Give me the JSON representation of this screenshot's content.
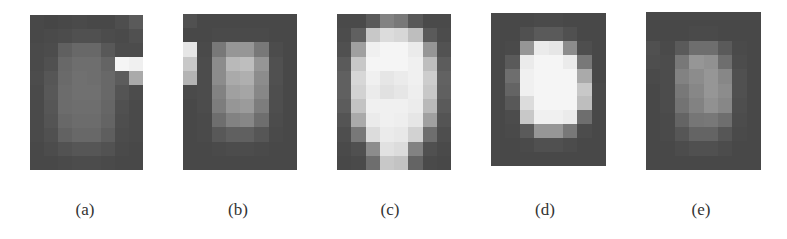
{
  "figure": {
    "panels": [
      {
        "id": "a",
        "label": "(a)",
        "x": 30,
        "y": 15,
        "w": 113,
        "h": 155,
        "label_x": 85,
        "cols": 8,
        "rows": 11,
        "grid": [
          [
            72,
            70,
            72,
            74,
            72,
            72,
            78,
            90
          ],
          [
            72,
            74,
            76,
            80,
            80,
            76,
            74,
            80
          ],
          [
            74,
            76,
            96,
            104,
            104,
            88,
            76,
            76
          ],
          [
            74,
            80,
            104,
            110,
            110,
            100,
            245,
            240
          ],
          [
            76,
            86,
            106,
            112,
            110,
            104,
            92,
            170
          ],
          [
            74,
            88,
            108,
            112,
            112,
            104,
            84,
            76
          ],
          [
            74,
            86,
            108,
            110,
            110,
            102,
            80,
            74
          ],
          [
            74,
            84,
            104,
            108,
            108,
            100,
            78,
            74
          ],
          [
            74,
            80,
            98,
            104,
            104,
            94,
            76,
            74
          ],
          [
            72,
            76,
            82,
            86,
            86,
            82,
            74,
            72
          ],
          [
            72,
            72,
            74,
            76,
            76,
            74,
            72,
            72
          ]
        ]
      },
      {
        "id": "b",
        "label": "(b)",
        "x": 183,
        "y": 14,
        "w": 114,
        "h": 156,
        "label_x": 238,
        "cols": 8,
        "rows": 11,
        "grid": [
          [
            80,
            72,
            72,
            72,
            72,
            72,
            72,
            72
          ],
          [
            72,
            72,
            74,
            74,
            74,
            74,
            72,
            72
          ],
          [
            230,
            74,
            120,
            150,
            150,
            120,
            76,
            72
          ],
          [
            200,
            76,
            140,
            185,
            190,
            150,
            80,
            72
          ],
          [
            180,
            76,
            140,
            170,
            175,
            140,
            80,
            72
          ],
          [
            74,
            76,
            130,
            160,
            165,
            135,
            78,
            72
          ],
          [
            72,
            76,
            125,
            150,
            155,
            125,
            78,
            72
          ],
          [
            72,
            74,
            110,
            130,
            135,
            110,
            76,
            72
          ],
          [
            72,
            74,
            88,
            96,
            96,
            86,
            74,
            72
          ],
          [
            72,
            72,
            74,
            76,
            76,
            74,
            72,
            72
          ],
          [
            72,
            72,
            72,
            72,
            72,
            72,
            72,
            72
          ]
        ]
      },
      {
        "id": "c",
        "label": "(c)",
        "x": 337,
        "y": 14,
        "w": 114,
        "h": 156,
        "label_x": 390,
        "cols": 8,
        "rows": 11,
        "grid": [
          [
            74,
            74,
            90,
            130,
            120,
            88,
            74,
            74
          ],
          [
            76,
            96,
            200,
            220,
            215,
            190,
            90,
            76
          ],
          [
            80,
            160,
            240,
            245,
            245,
            235,
            150,
            82
          ],
          [
            90,
            200,
            245,
            245,
            245,
            240,
            190,
            92
          ],
          [
            96,
            215,
            240,
            230,
            235,
            240,
            205,
            98
          ],
          [
            96,
            210,
            235,
            225,
            230,
            238,
            200,
            96
          ],
          [
            92,
            195,
            240,
            240,
            240,
            236,
            185,
            90
          ],
          [
            84,
            170,
            235,
            240,
            238,
            230,
            160,
            84
          ],
          [
            78,
            120,
            220,
            235,
            232,
            210,
            110,
            78
          ],
          [
            74,
            80,
            140,
            225,
            220,
            130,
            80,
            74
          ],
          [
            72,
            74,
            110,
            200,
            195,
            100,
            74,
            72
          ]
        ]
      },
      {
        "id": "d",
        "label": "(d)",
        "x": 491,
        "y": 13,
        "w": 115,
        "h": 153,
        "label_x": 545,
        "cols": 8,
        "rows": 11,
        "grid": [
          [
            72,
            72,
            72,
            74,
            74,
            72,
            72,
            72
          ],
          [
            72,
            72,
            80,
            90,
            90,
            80,
            72,
            72
          ],
          [
            72,
            74,
            150,
            235,
            230,
            140,
            78,
            72
          ],
          [
            72,
            90,
            235,
            245,
            245,
            235,
            120,
            72
          ],
          [
            72,
            110,
            240,
            245,
            245,
            245,
            170,
            72
          ],
          [
            72,
            100,
            240,
            245,
            245,
            245,
            200,
            74
          ],
          [
            72,
            88,
            220,
            245,
            245,
            245,
            190,
            74
          ],
          [
            72,
            76,
            200,
            240,
            240,
            235,
            110,
            72
          ],
          [
            72,
            74,
            90,
            150,
            150,
            120,
            76,
            72
          ],
          [
            72,
            72,
            74,
            80,
            80,
            76,
            72,
            72
          ],
          [
            72,
            72,
            72,
            72,
            72,
            72,
            72,
            72
          ]
        ]
      },
      {
        "id": "e",
        "label": "(e)",
        "x": 646,
        "y": 12,
        "w": 115,
        "h": 158,
        "label_x": 701,
        "cols": 8,
        "rows": 11,
        "grid": [
          [
            72,
            72,
            72,
            72,
            72,
            72,
            72,
            72
          ],
          [
            72,
            72,
            72,
            74,
            74,
            72,
            72,
            72
          ],
          [
            80,
            74,
            90,
            110,
            110,
            90,
            74,
            72
          ],
          [
            78,
            76,
            120,
            150,
            145,
            110,
            76,
            72
          ],
          [
            74,
            76,
            130,
            140,
            150,
            135,
            80,
            72
          ],
          [
            72,
            76,
            120,
            135,
            150,
            140,
            80,
            72
          ],
          [
            72,
            76,
            115,
            130,
            145,
            135,
            78,
            72
          ],
          [
            72,
            74,
            100,
            118,
            120,
            110,
            76,
            72
          ],
          [
            72,
            74,
            86,
            100,
            100,
            86,
            74,
            72
          ],
          [
            72,
            72,
            76,
            80,
            80,
            76,
            72,
            72
          ],
          [
            72,
            72,
            72,
            72,
            72,
            72,
            72,
            72
          ]
        ]
      }
    ]
  }
}
